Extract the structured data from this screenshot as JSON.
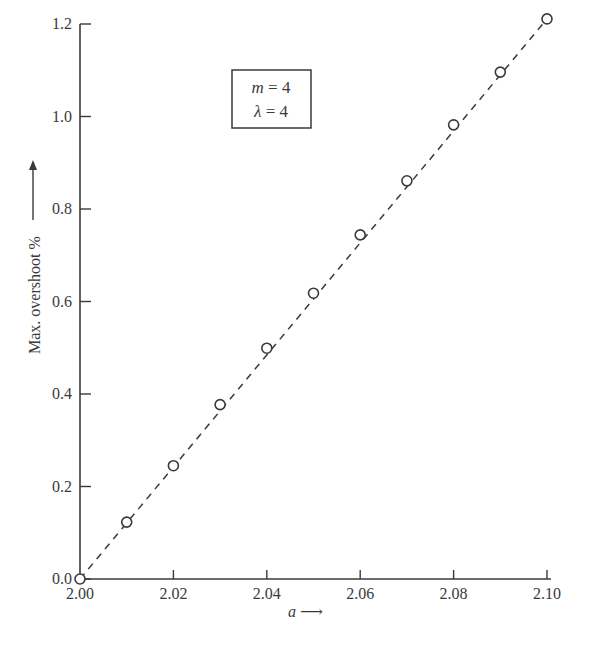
{
  "chart_data": {
    "type": "line",
    "title": "",
    "xlabel": "a →",
    "ylabel": "Max. overshoot % →",
    "xlim": [
      2.0,
      2.1
    ],
    "ylim": [
      0.0,
      1.2
    ],
    "x_ticks": [
      "2.00",
      "2.02",
      "2.04",
      "2.06",
      "2.08",
      "2.10"
    ],
    "y_ticks": [
      "0.0",
      "0.2",
      "0.4",
      "0.6",
      "0.8",
      "1.0",
      "1.2"
    ],
    "grid": false,
    "line_style": "dashed",
    "marker": "open-circle",
    "series": [
      {
        "name": "m=4, λ=4",
        "x": [
          2.0,
          2.01,
          2.02,
          2.03,
          2.04,
          2.05,
          2.06,
          2.07,
          2.08,
          2.09,
          2.1
        ],
        "values": [
          0.0,
          0.123,
          0.245,
          0.377,
          0.499,
          0.618,
          0.744,
          0.861,
          0.982,
          1.096,
          1.211
        ]
      }
    ],
    "legend": {
      "position": "upper-left-inside",
      "lines": [
        "m = 4",
        "λ = 4"
      ]
    }
  },
  "labels": {
    "x_axis_var": "a",
    "x_axis_arrow": "⟶",
    "y_axis_text": "Max. overshoot %",
    "legend_m": "m",
    "legend_m_val": " = 4",
    "legend_l": "λ",
    "legend_l_val": " = 4"
  }
}
